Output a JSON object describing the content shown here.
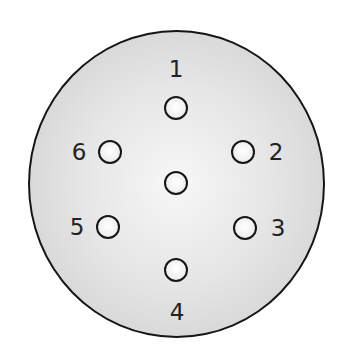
{
  "diagram": {
    "type": "connector-pinout",
    "colors": {
      "outline": "#151515",
      "face_center": "#f7f7f7",
      "face_edge": "#cbcbcb",
      "label": "#222222"
    },
    "pins": [
      {
        "id": "1",
        "label": "1",
        "x": 176,
        "y": 108,
        "label_x": 176,
        "label_y": 69
      },
      {
        "id": "2",
        "label": "2",
        "x": 243,
        "y": 152,
        "label_x": 276,
        "label_y": 152
      },
      {
        "id": "3",
        "label": "3",
        "x": 245,
        "y": 228,
        "label_x": 278,
        "label_y": 228
      },
      {
        "id": "4",
        "label": "4",
        "x": 176,
        "y": 270,
        "label_x": 177,
        "label_y": 312
      },
      {
        "id": "5",
        "label": "5",
        "x": 108,
        "y": 227,
        "label_x": 77,
        "label_y": 227
      },
      {
        "id": "6",
        "label": "6",
        "x": 110,
        "y": 152,
        "label_x": 79,
        "label_y": 152
      },
      {
        "id": "center",
        "label": "",
        "x": 176,
        "y": 183
      }
    ]
  }
}
